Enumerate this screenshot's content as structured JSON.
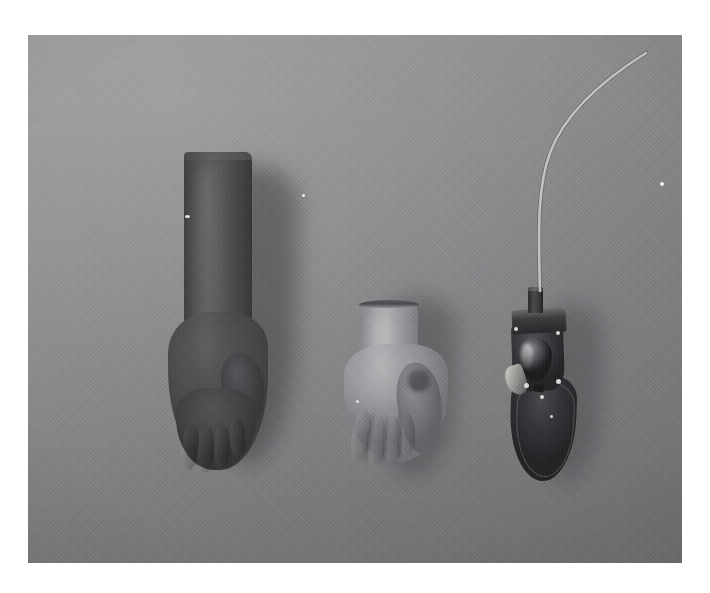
{
  "page": {
    "kind": "photograph",
    "background_color": "#ffffff",
    "width": 710,
    "height": 593
  },
  "photo": {
    "name": "prosthetic-hand-components-photo",
    "frame": {
      "left": 28,
      "top": 35,
      "width": 654,
      "height": 528
    },
    "medium": "black-and-white photographic print",
    "backdrop_color": "#8b8b8b",
    "backdrop_description": "flat light-gray fabric/canvas backdrop with fine woven texture, lit from upper left",
    "lighting": "soft directional light from upper left, soft shadows falling to the lower right of each object",
    "subjects": [
      {
        "id": "dark-arm",
        "label": "dark cosmetic glove on forearm form",
        "description": "tall dark-gray cosmetic glove pulled over a forearm and hand form, knuckles and four fingers visible at the bottom, thumb to the right, open cuff at top",
        "tone": "dark gray",
        "color": "#4a4a4d",
        "position": {
          "left": 132,
          "top": 117,
          "width": 120,
          "height": 320
        }
      },
      {
        "id": "light-hand",
        "label": "light cosmetic hand glove",
        "description": "pale flesh-tone cosmetic hand with open dark wrist rim, four curled fingers and a shadowed thumb",
        "tone": "light gray",
        "color": "#a3a2a6",
        "position": {
          "left": 312,
          "top": 265,
          "width": 120,
          "height": 180
        }
      },
      {
        "id": "mech-hand",
        "label": "mechanical prosthetic hand mechanism",
        "description": "dark metal prosthetic hand mechanism with cylindrical wrist post, chassis block, exposed mechanism, screws and finger frame, with a control cable running up and off the top of the frame",
        "tone": "very dark gray with metallic highlights",
        "color": "#35353a",
        "position": {
          "left": 466,
          "top": 252,
          "width": 110,
          "height": 200
        }
      }
    ],
    "cable": {
      "label": "control cable",
      "description": "pale cord rising from the wrist post, curving right and exiting the top edge of the photograph",
      "color": "#c9c9c4"
    },
    "specks": [
      {
        "label": "print-dust-right",
        "left": 632,
        "top": 147
      },
      {
        "label": "print-dust-middle",
        "left": 274,
        "top": 159
      },
      {
        "label": "print-dust-on-glove",
        "left": 157,
        "top": 180
      }
    ]
  },
  "colors": {
    "paper": "#ffffff",
    "backdrop": "#8b8b8b",
    "dark_object": "#4a4a4d",
    "light_object": "#a3a2a6",
    "mechanism": "#35353a",
    "cable": "#c9c9c4",
    "shadow": "rgba(40,40,42,0.35)"
  }
}
